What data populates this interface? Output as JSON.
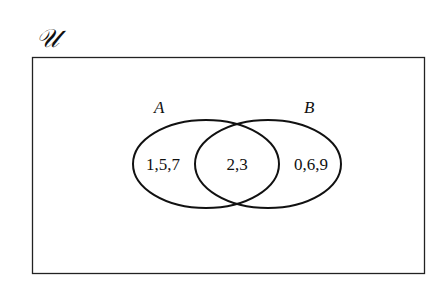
{
  "diagram": {
    "type": "venn",
    "universe_label": "𝒰",
    "sets": [
      {
        "name": "A",
        "only_elements": "1,5,7"
      },
      {
        "name": "B",
        "only_elements": "0,6,9"
      }
    ],
    "intersection_elements": "2,3",
    "stroke_color": "#111111",
    "background": "#ffffff"
  }
}
